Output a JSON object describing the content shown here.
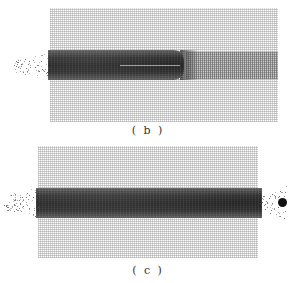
{
  "figure": {
    "panels": [
      {
        "id": "b",
        "label": "( b )"
      },
      {
        "id": "c",
        "label": "( c )"
      }
    ],
    "colors": {
      "background": "#ffffff",
      "mesh": "#5a5a5a",
      "band": "#2e2e2e",
      "projectile": "#111111"
    }
  }
}
